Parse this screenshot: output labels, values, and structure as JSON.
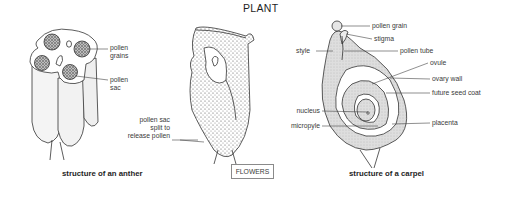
{
  "title": "PLANT",
  "section_box": "FLOWERS",
  "anther": {
    "caption": "structure of an anther",
    "labels": {
      "pollen_grains": [
        "pollen",
        "grains"
      ],
      "pollen_sac": [
        "pollen",
        "sac"
      ],
      "pollen_sac_split": [
        "pollen sac",
        "split to",
        "release pollen"
      ]
    }
  },
  "carpel": {
    "caption": "structure of a carpel",
    "labels": {
      "pollen_grain": "pollen grain",
      "stigma": "stigma",
      "style": "style",
      "pollen_tube": "pollen tube",
      "ovule": "ovule",
      "ovary_wall": "ovary wall",
      "future_seed_coat": "future seed coat",
      "nucleus": "nucleus",
      "micropyle": "micropyle",
      "placenta": "placenta"
    }
  },
  "colors": {
    "ink": "#2a2a2a",
    "stipple_fill": "#d9d9d9",
    "box_border": "#8a8a8a"
  }
}
